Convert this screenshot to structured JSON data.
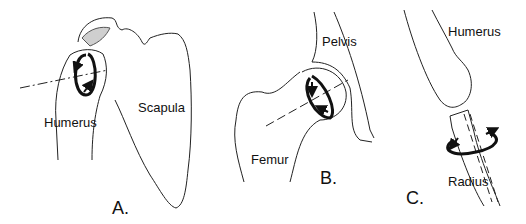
{
  "figure": {
    "panels": [
      {
        "id": "A",
        "label": "A.",
        "bones": [
          "Humerus",
          "Scapula"
        ],
        "joint": "shoulder",
        "motion": "rotation of humeral head about its axis"
      },
      {
        "id": "B",
        "label": "B.",
        "bones": [
          "Pelvis",
          "Femur"
        ],
        "joint": "hip",
        "motion": "rotation of femoral head about its axis"
      },
      {
        "id": "C",
        "label": "C.",
        "bones": [
          "Humerus",
          "Radius"
        ],
        "joint": "elbow",
        "motion": "rotation of radius about its long axis"
      }
    ],
    "labels": {
      "a_humerus": "Humerus",
      "a_scapula": "Scapula",
      "a_panel": "A.",
      "b_pelvis": "Pelvis",
      "b_femur": "Femur",
      "b_panel": "B.",
      "c_humerus": "Humerus",
      "c_radius": "Radius",
      "c_panel": "C."
    },
    "colors": {
      "line": "#222222",
      "arrow": "#111111",
      "shade": "#cfcfcf",
      "background": "#ffffff"
    }
  }
}
